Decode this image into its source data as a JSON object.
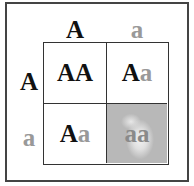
{
  "diagram": {
    "type": "punnett-square",
    "column_alleles": [
      "A",
      "a"
    ],
    "row_alleles": [
      "A",
      "a"
    ],
    "cells": [
      [
        {
          "dominant": "AA",
          "recessive": ""
        },
        {
          "dominant": "A",
          "recessive": "a"
        }
      ],
      [
        {
          "dominant": "A",
          "recessive": "a"
        },
        {
          "dominant": "",
          "recessive": "aa"
        }
      ]
    ],
    "colors": {
      "dominant": "#111111",
      "recessive": "#999999",
      "highlight_cell": "#b8b8b8"
    }
  }
}
